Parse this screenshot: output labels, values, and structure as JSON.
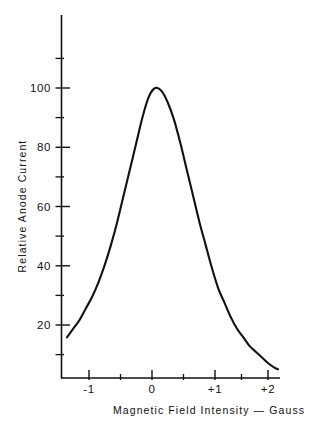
{
  "chart_data": {
    "type": "line",
    "title": "",
    "subtitle": "",
    "xlabel": "Magnetic Field  Intensity — Gauss",
    "ylabel": "Relative Anode Current",
    "xlim": [
      -1.45,
      2.1
    ],
    "ylim": [
      0,
      115
    ],
    "grid": false,
    "legend_position": "none",
    "x_ticks_major": [
      "-1",
      "0",
      "+1",
      "+2"
    ],
    "x_tick_values_major": [
      -1,
      0,
      1,
      2
    ],
    "x_tick_values_minor": [
      -1.5,
      -0.5,
      0.5,
      1.5
    ],
    "y_ticks_major": [
      "20",
      "40",
      "60",
      "80",
      "100"
    ],
    "y_tick_values_major": [
      20,
      40,
      60,
      80,
      100
    ],
    "y_tick_values_minor": [
      10,
      30,
      50,
      70,
      90,
      110
    ],
    "series": [
      {
        "name": "Relative Anode Current",
        "x": [
          -1.35,
          -1.25,
          -1.15,
          -1.05,
          -0.95,
          -0.85,
          -0.75,
          -0.65,
          -0.55,
          -0.45,
          -0.35,
          -0.25,
          -0.15,
          -0.05,
          0.05,
          0.15,
          0.25,
          0.35,
          0.45,
          0.55,
          0.65,
          0.75,
          0.85,
          0.95,
          1.05,
          1.15,
          1.25,
          1.35,
          1.45,
          1.55,
          1.65,
          1.75,
          1.85,
          1.95,
          2.0
        ],
        "values": [
          14,
          17,
          20,
          24,
          28,
          33,
          39,
          46,
          54,
          63,
          72,
          81,
          90,
          97,
          100,
          99,
          95,
          89,
          81,
          72,
          63,
          54,
          46,
          38,
          31,
          26,
          21,
          17,
          14,
          11,
          9,
          7,
          5,
          3.5,
          3
        ]
      }
    ],
    "peak": {
      "x": -0.02,
      "y": 100
    },
    "colors": {
      "line": "#111111",
      "axis": "#111111",
      "background": "#ffffff"
    }
  },
  "axes": {
    "y_axis_label": "Relative Anode Current",
    "x_axis_label": "Magnetic Field  Intensity — Gauss",
    "y_labels": [
      "100",
      "80",
      "60",
      "40",
      "20"
    ],
    "x_labels": [
      "-1",
      "0",
      "+1",
      "+2"
    ]
  }
}
